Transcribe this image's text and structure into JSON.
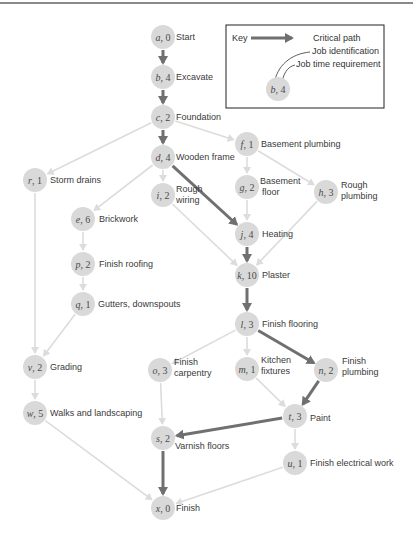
{
  "colors": {
    "node_fill": "#d9d9d9",
    "normal_edge": "#dcdcdc",
    "critical_edge": "#707070",
    "text": "#3a3a3a"
  },
  "key": {
    "title": "Key",
    "critical_path": "Critical path",
    "job_identification": "Job identification",
    "job_time_requirement": "Job time requirement",
    "example_id": "b",
    "example_time": "4"
  },
  "nodes": [
    {
      "id": "a",
      "time": "0",
      "label": "Start",
      "x": 163,
      "y": 37
    },
    {
      "id": "b",
      "time": "4",
      "label": "Excavate",
      "x": 163,
      "y": 77
    },
    {
      "id": "c",
      "time": "2",
      "label": "Foundation",
      "x": 163,
      "y": 117
    },
    {
      "id": "d",
      "time": "4",
      "label": "Wooden frame",
      "x": 163,
      "y": 157
    },
    {
      "id": "f",
      "time": "1",
      "label": "Basement plumbing",
      "x": 247,
      "y": 144
    },
    {
      "id": "r",
      "time": "1",
      "label": "Storm drains",
      "x": 35,
      "y": 180
    },
    {
      "id": "i",
      "time": "2",
      "label": "Rough wiring",
      "x": 163,
      "y": 195
    },
    {
      "id": "g",
      "time": "2",
      "label": "Basement floor",
      "x": 247,
      "y": 187
    },
    {
      "id": "h",
      "time": "3",
      "label": "Rough plumbing",
      "x": 326,
      "y": 192
    },
    {
      "id": "e",
      "time": "6",
      "label": "Brickwork",
      "x": 83,
      "y": 219
    },
    {
      "id": "j",
      "time": "4",
      "label": "Heating",
      "x": 247,
      "y": 234
    },
    {
      "id": "p",
      "time": "2",
      "label": "Finish roofing",
      "x": 83,
      "y": 264
    },
    {
      "id": "k",
      "time": "10",
      "label": "Plaster",
      "x": 247,
      "y": 275
    },
    {
      "id": "q",
      "time": "1",
      "label": "Gutters, downspouts",
      "x": 83,
      "y": 304
    },
    {
      "id": "l",
      "time": "3",
      "label": "Finish flooring",
      "x": 247,
      "y": 324
    },
    {
      "id": "v",
      "time": "2",
      "label": "Grading",
      "x": 35,
      "y": 367
    },
    {
      "id": "o",
      "time": "3",
      "label": "Finish carpentry",
      "x": 160,
      "y": 370
    },
    {
      "id": "m",
      "time": "1",
      "label": "Kitchen fixtures",
      "x": 247,
      "y": 369
    },
    {
      "id": "n",
      "time": "2",
      "label": "Finish plumbing",
      "x": 326,
      "y": 370
    },
    {
      "id": "w",
      "time": "5",
      "label": "Walks and landscaping",
      "x": 35,
      "y": 413
    },
    {
      "id": "t",
      "time": "3",
      "label": "Paint",
      "x": 295,
      "y": 416
    },
    {
      "id": "s",
      "time": "2",
      "label": "Varnish floors",
      "x": 163,
      "y": 438
    },
    {
      "id": "u",
      "time": "1",
      "label": "Finish electrical work",
      "x": 295,
      "y": 463
    },
    {
      "id": "x",
      "time": "0",
      "label": "Finish",
      "x": 163,
      "y": 508
    }
  ],
  "edges": [
    {
      "from": "a",
      "to": "b",
      "critical": true
    },
    {
      "from": "b",
      "to": "c",
      "critical": true
    },
    {
      "from": "c",
      "to": "d",
      "critical": true
    },
    {
      "from": "c",
      "to": "f",
      "critical": false
    },
    {
      "from": "c",
      "to": "r",
      "critical": false
    },
    {
      "from": "d",
      "to": "e",
      "critical": false
    },
    {
      "from": "d",
      "to": "i",
      "critical": false
    },
    {
      "from": "d",
      "to": "j",
      "critical": true
    },
    {
      "from": "f",
      "to": "g",
      "critical": false
    },
    {
      "from": "f",
      "to": "h",
      "critical": false
    },
    {
      "from": "g",
      "to": "j",
      "critical": false
    },
    {
      "from": "i",
      "to": "k",
      "critical": false
    },
    {
      "from": "j",
      "to": "k",
      "critical": true
    },
    {
      "from": "h",
      "to": "k",
      "critical": false
    },
    {
      "from": "e",
      "to": "p",
      "critical": false
    },
    {
      "from": "p",
      "to": "q",
      "critical": false
    },
    {
      "from": "q",
      "to": "v",
      "critical": false
    },
    {
      "from": "r",
      "to": "v",
      "critical": false
    },
    {
      "from": "v",
      "to": "w",
      "critical": false
    },
    {
      "from": "k",
      "to": "l",
      "critical": true
    },
    {
      "from": "l",
      "to": "o",
      "critical": false
    },
    {
      "from": "l",
      "to": "m",
      "critical": false
    },
    {
      "from": "l",
      "to": "n",
      "critical": true
    },
    {
      "from": "m",
      "to": "t",
      "critical": false
    },
    {
      "from": "n",
      "to": "t",
      "critical": true
    },
    {
      "from": "o",
      "to": "s",
      "critical": false
    },
    {
      "from": "t",
      "to": "s",
      "critical": true
    },
    {
      "from": "t",
      "to": "u",
      "critical": false
    },
    {
      "from": "s",
      "to": "x",
      "critical": true
    },
    {
      "from": "w",
      "to": "x",
      "critical": false
    },
    {
      "from": "u",
      "to": "x",
      "critical": false
    }
  ]
}
